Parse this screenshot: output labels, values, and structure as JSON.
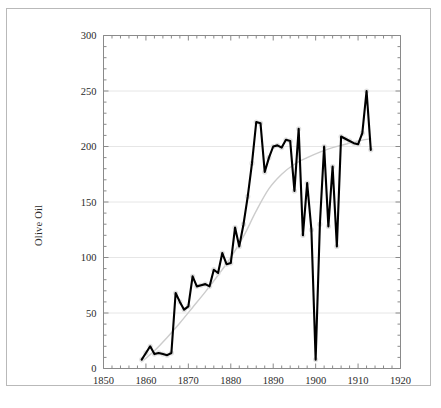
{
  "figure": {
    "background_color": "#ffffff",
    "frame_color": "#b9b9b9",
    "gridline_color": "#e6e6e6",
    "axis_color": "#8a8a8a",
    "series_color": "#000000",
    "trend_color": "#cccccc",
    "marker_halo_color": "#e2e2e2"
  },
  "chart_data": {
    "type": "line",
    "title": "",
    "subtitle": "",
    "xlabel": "",
    "ylabel": "Olive Oil",
    "xlim": [
      1850,
      1920
    ],
    "ylim": [
      0,
      300
    ],
    "grid": true,
    "legend": "none",
    "x_major_ticks": [
      1850,
      1860,
      1870,
      1880,
      1890,
      1900,
      1910,
      1920
    ],
    "x_tick_labels": [
      "1850",
      "1860",
      "1870",
      "1880",
      "1890",
      "1900",
      "1910",
      "1920"
    ],
    "x_minor_tick_step": 2,
    "y_major_ticks": [
      0,
      50,
      100,
      150,
      200,
      250,
      300
    ],
    "y_tick_labels": [
      "0",
      "50",
      "100",
      "150",
      "200",
      "250",
      "300"
    ],
    "y_minor_tick_step": 10,
    "series": [
      {
        "name": "Olive Oil",
        "style": "line-with-markers",
        "x": [
          1859,
          1860,
          1861,
          1862,
          1863,
          1864,
          1865,
          1866,
          1867,
          1868,
          1869,
          1870,
          1871,
          1872,
          1873,
          1874,
          1875,
          1876,
          1877,
          1878,
          1879,
          1880,
          1881,
          1882,
          1883,
          1884,
          1885,
          1886,
          1887,
          1888,
          1889,
          1890,
          1891,
          1892,
          1893,
          1894,
          1895,
          1896,
          1897,
          1898,
          1899,
          1900,
          1901,
          1902,
          1903,
          1904,
          1905,
          1906,
          1907,
          1908,
          1909,
          1910,
          1911,
          1912,
          1913
        ],
        "values": [
          8,
          14,
          20,
          13,
          14,
          13,
          12,
          14,
          68,
          60,
          53,
          56,
          83,
          74,
          75,
          76,
          74,
          89,
          86,
          104,
          94,
          95,
          127,
          110,
          130,
          155,
          185,
          222,
          221,
          177,
          190,
          200,
          201,
          199,
          206,
          205,
          160,
          216,
          120,
          167,
          125,
          8,
          130,
          200,
          128,
          182,
          110,
          209,
          207,
          205,
          203,
          202,
          212,
          250,
          197
        ]
      },
      {
        "name": "trend",
        "style": "smooth-trend-line",
        "x": [
          1859,
          1862,
          1865,
          1868,
          1871,
          1874,
          1877,
          1880,
          1883,
          1886,
          1889,
          1892,
          1895,
          1898,
          1901,
          1904,
          1907,
          1910,
          1913
        ],
        "values": [
          6,
          16,
          28,
          41,
          55,
          69,
          84,
          100,
          119,
          142,
          162,
          175,
          184,
          190,
          195,
          199,
          202,
          205,
          207
        ]
      }
    ]
  }
}
